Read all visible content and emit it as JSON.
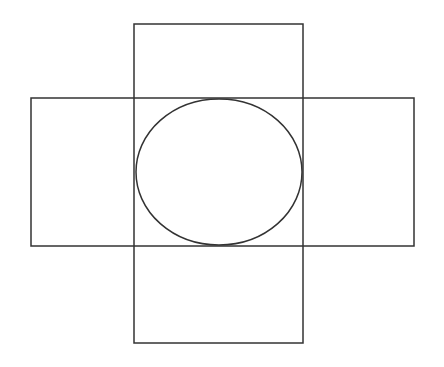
{
  "diagram": {
    "stroke_color": "#333333",
    "background": "#ffffff",
    "shapes": {
      "vertical_rect": {
        "x": 134,
        "y": 24,
        "width": 169,
        "height": 319
      },
      "horizontal_rect": {
        "x": 31,
        "y": 98,
        "width": 383,
        "height": 148
      },
      "ellipse": {
        "cx": 219,
        "cy": 172,
        "rx": 83,
        "ry": 73
      }
    }
  }
}
